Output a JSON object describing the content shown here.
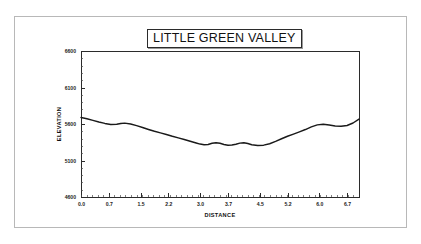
{
  "figure": {
    "title": "LITTLE GREEN VALLEY",
    "border_color": "#b8b8b8",
    "background": "#ffffff",
    "line_color": "#1a1a1a"
  },
  "chart_data": {
    "type": "line",
    "title": "LITTLE GREEN VALLEY",
    "xlabel": "DISTANCE",
    "ylabel": "ELEVATION",
    "xlim": [
      0.0,
      7.0
    ],
    "ylim": [
      4600,
      6600
    ],
    "grid": false,
    "legend": null,
    "xticks": [
      0.0,
      0.7,
      1.5,
      2.2,
      3.0,
      3.7,
      4.5,
      5.2,
      6.0,
      6.7
    ],
    "xtick_labels": [
      "0.0",
      "0.7",
      "1.5",
      "2.2",
      "3.0",
      "3.7",
      "4.5",
      "5.2",
      "6.0",
      "6.7"
    ],
    "yticks": [
      4600,
      5100,
      5600,
      6100,
      6600
    ],
    "ytick_labels": [
      "4600",
      "5100",
      "5600",
      "6100",
      "6600"
    ],
    "series": [
      {
        "name": "elevation-profile",
        "x": [
          0.0,
          0.15,
          0.3,
          0.45,
          0.6,
          0.75,
          0.9,
          1.0,
          1.1,
          1.25,
          1.4,
          1.55,
          1.7,
          1.85,
          2.0,
          2.15,
          2.3,
          2.45,
          2.6,
          2.75,
          2.9,
          3.0,
          3.1,
          3.2,
          3.3,
          3.4,
          3.5,
          3.6,
          3.7,
          3.8,
          3.9,
          4.0,
          4.1,
          4.2,
          4.3,
          4.45,
          4.6,
          4.75,
          4.9,
          5.05,
          5.2,
          5.35,
          5.5,
          5.65,
          5.8,
          5.95,
          6.1,
          6.25,
          6.4,
          6.55,
          6.7,
          6.85,
          7.0
        ],
        "y": [
          5690,
          5672,
          5650,
          5628,
          5608,
          5594,
          5596,
          5608,
          5612,
          5600,
          5578,
          5552,
          5525,
          5500,
          5478,
          5456,
          5432,
          5410,
          5388,
          5364,
          5340,
          5325,
          5316,
          5320,
          5336,
          5344,
          5336,
          5320,
          5310,
          5312,
          5322,
          5338,
          5344,
          5332,
          5316,
          5306,
          5310,
          5330,
          5362,
          5398,
          5432,
          5462,
          5492,
          5524,
          5560,
          5588,
          5596,
          5586,
          5572,
          5568,
          5580,
          5614,
          5668
        ]
      }
    ]
  }
}
